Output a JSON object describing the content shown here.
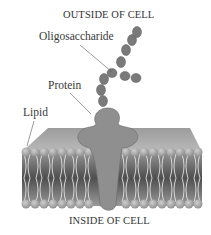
{
  "diagram": {
    "title_top": "OUTSIDE OF CELL",
    "title_bottom": "INSIDE OF CELL",
    "labels": {
      "oligosaccharide": "Oligosaccharide",
      "protein": "Protein",
      "lipid": "Lipid"
    },
    "colors": {
      "protein": "#8f8f8f",
      "lipid_head": "#a9a9a9",
      "sugar": "#7a7a7a",
      "tails": "#e8e8e8",
      "leader_line": "#555555"
    }
  }
}
